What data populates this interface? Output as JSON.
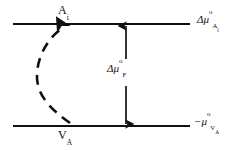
{
  "figure": {
    "type": "energy-level-diagram",
    "background_color": "#ffffff",
    "stroke_color": "#111111",
    "title": ""
  },
  "levels": [
    {
      "id": "upper-level",
      "species_label": "A",
      "species_subscript": "i",
      "energy_label_prefix": "Δμ",
      "energy_label_superscript": "o",
      "energy_label_subscript": "A",
      "energy_label_subsubscript": "i",
      "y": 24,
      "x_start": 13,
      "x_end": 190
    },
    {
      "id": "lower-level",
      "species_label": "V",
      "species_subscript": "A",
      "energy_label_prefix": "−μ",
      "energy_label_superscript": "o",
      "energy_label_subscript": "V",
      "energy_label_subsubscript": "A",
      "y": 126,
      "x_start": 13,
      "x_end": 190
    }
  ],
  "gap_arrow": {
    "id": "formation-energy-arrow",
    "label_prefix": "Δμ",
    "label_superscript": "o",
    "label_subscript": "F",
    "x": 126,
    "y_top": 24,
    "y_bottom": 126,
    "double_headed": true
  },
  "reaction_path": {
    "id": "dashed-transition-curve",
    "style": "dashed",
    "from_level": "lower-level",
    "to_level": "upper-level",
    "arrowhead_at": "upper-level",
    "from_x": 70,
    "to_x": 66,
    "bow_direction": "left"
  },
  "text": {
    "top_species": "A",
    "top_species_sub": "i",
    "bottom_species": "V",
    "bottom_species_sub": "A",
    "delta_mu": "Δμ",
    "minus_mu": "−μ",
    "sup_standard": "o",
    "sub_F": "F",
    "sub_A": "A",
    "sub_i": "i",
    "sub_V": "V"
  }
}
